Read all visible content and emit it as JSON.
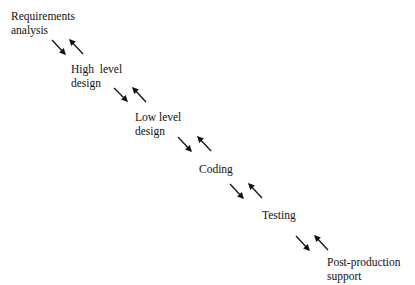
{
  "diagram": {
    "type": "waterfall-model",
    "stages": [
      {
        "id": "requirements",
        "lines": [
          "Requirements",
          "analysis"
        ],
        "x": 11,
        "y": 9
      },
      {
        "id": "high-level-design",
        "lines": [
          "High  level",
          "design"
        ],
        "x": 71,
        "y": 62
      },
      {
        "id": "low-level-design",
        "lines": [
          "Low level",
          "design"
        ],
        "x": 135,
        "y": 110
      },
      {
        "id": "coding",
        "lines": [
          "Coding"
        ],
        "x": 199,
        "y": 162
      },
      {
        "id": "testing",
        "lines": [
          "Testing"
        ],
        "x": 262,
        "y": 208
      },
      {
        "id": "post-production-support",
        "lines": [
          "Post-production",
          "support"
        ],
        "x": 327,
        "y": 255
      }
    ],
    "arrow_pairs": [
      {
        "between": [
          "requirements",
          "high-level-design"
        ],
        "forward": [
          52,
          40,
          65,
          54
        ],
        "backward": [
          83,
          54,
          70,
          40
        ]
      },
      {
        "between": [
          "high-level-design",
          "low-level-design"
        ],
        "forward": [
          114,
          88,
          127,
          101
        ],
        "backward": [
          146,
          102,
          133,
          88
        ]
      },
      {
        "between": [
          "low-level-design",
          "coding"
        ],
        "forward": [
          178,
          137,
          191,
          151
        ],
        "backward": [
          211,
          151,
          198,
          137
        ]
      },
      {
        "between": [
          "coding",
          "testing"
        ],
        "forward": [
          230,
          184,
          243,
          198
        ],
        "backward": [
          262,
          198,
          249,
          184
        ]
      },
      {
        "between": [
          "testing",
          "post-production-support"
        ],
        "forward": [
          296,
          236,
          309,
          250
        ],
        "backward": [
          328,
          250,
          315,
          236
        ]
      }
    ],
    "colors": {
      "text": "#111111",
      "arrow": "#111111",
      "background": "#ffffff"
    }
  }
}
